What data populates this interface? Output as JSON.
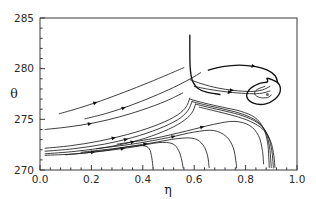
{
  "figure": {
    "name": "phase-portrait",
    "background_color": "#ffffff",
    "line_color": "#1c1c1c",
    "frame_color": "#3a3a3a"
  },
  "chart_data": {
    "type": "line",
    "title": "",
    "subtitle": "",
    "xlabel": "η",
    "ylabel": "θ",
    "xlim": [
      0.0,
      1.0
    ],
    "ylim": [
      270,
      285
    ],
    "grid": false,
    "legend": null,
    "x_ticks": [
      "0.0",
      "0.2",
      "0.4",
      "0.6",
      "0.8",
      "1.0"
    ],
    "x_tick_values": [
      0.0,
      0.2,
      0.4,
      0.6,
      0.8,
      1.0
    ],
    "x_minor_ticks_per_interval": 4,
    "y_ticks": [
      "270",
      "275",
      "280",
      "285"
    ],
    "y_tick_values": [
      270,
      275,
      280,
      285
    ],
    "y_minor_ticks_per_interval": 4,
    "annotations": [
      {
        "name": "spiral-focus",
        "label": "",
        "x": 0.885,
        "y": 277.45,
        "kind": "stable-focus"
      },
      {
        "name": "cusp-spike",
        "label": "",
        "x": 0.583,
        "y": 283.2,
        "kind": "vertical-separatrix"
      }
    ],
    "series": [
      {
        "name": "upper-trajectory-1",
        "points": [
          [
            0.075,
            275.55
          ],
          [
            0.15,
            276.1
          ],
          [
            0.24,
            276.85
          ],
          [
            0.33,
            277.7
          ],
          [
            0.42,
            278.6
          ],
          [
            0.5,
            279.45
          ],
          [
            0.56,
            280.1
          ]
        ],
        "arrows": [
          {
            "t": 0.3,
            "dir": "forward"
          }
        ]
      },
      {
        "name": "upper-trajectory-2",
        "points": [
          [
            0.175,
            275.05
          ],
          [
            0.26,
            275.6
          ],
          [
            0.35,
            276.35
          ],
          [
            0.44,
            277.25
          ],
          [
            0.52,
            278.15
          ],
          [
            0.585,
            279.0
          ],
          [
            0.625,
            279.6
          ]
        ],
        "arrows": [
          {
            "t": 0.34,
            "dir": "forward"
          }
        ]
      },
      {
        "name": "upper-trajectory-3",
        "points": [
          [
            0.02,
            274.0
          ],
          [
            0.11,
            274.25
          ],
          [
            0.21,
            274.65
          ],
          [
            0.31,
            275.25
          ],
          [
            0.4,
            275.95
          ],
          [
            0.49,
            276.8
          ],
          [
            0.555,
            277.6
          ]
        ],
        "arrows": [
          {
            "t": 0.33,
            "dir": "forward"
          }
        ]
      },
      {
        "name": "incoming-separatrix-upper",
        "points": [
          [
            0.583,
            283.3
          ],
          [
            0.583,
            281.6
          ],
          [
            0.584,
            280.3
          ],
          [
            0.588,
            279.3
          ],
          [
            0.597,
            278.6
          ],
          [
            0.615,
            278.05
          ],
          [
            0.645,
            277.7
          ],
          [
            0.7,
            277.45
          ]
        ],
        "arrows": []
      },
      {
        "name": "saddle-branch-left-a",
        "points": [
          [
            0.02,
            272.15
          ],
          [
            0.12,
            272.4
          ],
          [
            0.23,
            272.85
          ],
          [
            0.34,
            273.5
          ],
          [
            0.44,
            274.3
          ],
          [
            0.52,
            275.2
          ],
          [
            0.565,
            276.1
          ],
          [
            0.583,
            277.1
          ]
        ],
        "arrows": [
          {
            "t": 0.45,
            "dir": "forward"
          }
        ]
      },
      {
        "name": "saddle-branch-left-b",
        "points": [
          [
            0.02,
            271.85
          ],
          [
            0.13,
            272.1
          ],
          [
            0.25,
            272.55
          ],
          [
            0.36,
            273.2
          ],
          [
            0.46,
            274.05
          ],
          [
            0.535,
            274.95
          ],
          [
            0.575,
            275.85
          ],
          [
            0.592,
            276.8
          ]
        ],
        "arrows": [
          {
            "t": 0.52,
            "dir": "forward"
          }
        ]
      },
      {
        "name": "saddle-branch-left-c",
        "points": [
          [
            0.02,
            271.6
          ],
          [
            0.14,
            271.85
          ],
          [
            0.27,
            272.3
          ],
          [
            0.385,
            272.95
          ],
          [
            0.48,
            273.8
          ],
          [
            0.55,
            274.7
          ],
          [
            0.59,
            275.6
          ],
          [
            0.605,
            276.5
          ]
        ],
        "arrows": [
          {
            "t": 0.55,
            "dir": "forward"
          }
        ]
      },
      {
        "name": "outgoing-to-spiral-1",
        "points": [
          [
            0.585,
            278.9
          ],
          [
            0.63,
            278.5
          ],
          [
            0.69,
            278.1
          ],
          [
            0.755,
            277.85
          ],
          [
            0.82,
            277.75
          ],
          [
            0.865,
            277.9
          ],
          [
            0.895,
            278.25
          ]
        ],
        "arrows": [
          {
            "t": 0.55,
            "dir": "forward"
          }
        ]
      },
      {
        "name": "outgoing-to-spiral-2",
        "points": [
          [
            0.6,
            278.25
          ],
          [
            0.66,
            277.95
          ],
          [
            0.73,
            277.7
          ],
          [
            0.8,
            277.55
          ],
          [
            0.855,
            277.55
          ],
          [
            0.895,
            277.8
          ]
        ],
        "arrows": [
          {
            "t": 0.5,
            "dir": "forward"
          }
        ]
      },
      {
        "name": "separatrix-over-spiral",
        "points": [
          [
            0.655,
            279.85
          ],
          [
            0.71,
            280.2
          ],
          [
            0.775,
            280.35
          ],
          [
            0.84,
            280.2
          ],
          [
            0.885,
            279.85
          ],
          [
            0.915,
            279.3
          ],
          [
            0.925,
            278.6
          ]
        ],
        "arrows": [
          {
            "t": 0.62,
            "dir": "forward"
          }
        ]
      },
      {
        "name": "limit-cycle-outer",
        "points": [
          [
            0.885,
            279.05
          ],
          [
            0.925,
            278.6
          ],
          [
            0.935,
            277.8
          ],
          [
            0.915,
            277.0
          ],
          [
            0.875,
            276.5
          ],
          [
            0.83,
            276.6
          ],
          [
            0.805,
            277.2
          ],
          [
            0.815,
            277.95
          ],
          [
            0.85,
            278.5
          ],
          [
            0.885,
            278.7
          ]
        ],
        "closed": true,
        "arrows": []
      },
      {
        "name": "spiral-inner",
        "points": [
          [
            0.875,
            278.25
          ],
          [
            0.845,
            277.95
          ],
          [
            0.835,
            277.5
          ],
          [
            0.855,
            277.15
          ],
          [
            0.885,
            277.15
          ],
          [
            0.9,
            277.4
          ]
        ],
        "arrows": []
      },
      {
        "name": "lower-falling-1",
        "points": [
          [
            0.02,
            271.45
          ],
          [
            0.14,
            271.6
          ],
          [
            0.26,
            271.95
          ],
          [
            0.345,
            272.3
          ],
          [
            0.4,
            272.4
          ],
          [
            0.425,
            272.1
          ],
          [
            0.435,
            271.2
          ],
          [
            0.44,
            270.2
          ]
        ],
        "arrows": [
          {
            "t": 0.4,
            "dir": "forward"
          }
        ]
      },
      {
        "name": "lower-falling-2",
        "points": [
          [
            0.1,
            271.5
          ],
          [
            0.24,
            271.85
          ],
          [
            0.37,
            272.3
          ],
          [
            0.46,
            272.7
          ],
          [
            0.515,
            272.6
          ],
          [
            0.54,
            271.9
          ],
          [
            0.552,
            270.9
          ],
          [
            0.557,
            270.2
          ]
        ],
        "arrows": [
          {
            "t": 0.44,
            "dir": "forward"
          }
        ]
      },
      {
        "name": "lower-falling-3",
        "points": [
          [
            0.16,
            271.75
          ],
          [
            0.3,
            272.15
          ],
          [
            0.43,
            272.65
          ],
          [
            0.535,
            273.1
          ],
          [
            0.6,
            273.1
          ],
          [
            0.635,
            272.45
          ],
          [
            0.652,
            271.4
          ],
          [
            0.658,
            270.25
          ]
        ],
        "arrows": [
          {
            "t": 0.45,
            "dir": "forward"
          }
        ]
      },
      {
        "name": "lower-falling-4",
        "points": [
          [
            0.22,
            272.1
          ],
          [
            0.37,
            272.6
          ],
          [
            0.5,
            273.2
          ],
          [
            0.6,
            273.75
          ],
          [
            0.675,
            273.9
          ],
          [
            0.725,
            273.3
          ],
          [
            0.752,
            272.2
          ],
          [
            0.762,
            270.9
          ],
          [
            0.765,
            270.2
          ]
        ],
        "arrows": [
          {
            "t": 0.48,
            "dir": "forward"
          }
        ]
      },
      {
        "name": "lower-falling-5",
        "points": [
          [
            0.3,
            272.55
          ],
          [
            0.44,
            273.1
          ],
          [
            0.57,
            273.85
          ],
          [
            0.675,
            274.5
          ],
          [
            0.755,
            274.8
          ],
          [
            0.815,
            274.4
          ],
          [
            0.85,
            273.4
          ],
          [
            0.865,
            272.0
          ],
          [
            0.87,
            270.6
          ]
        ],
        "arrows": [
          {
            "t": 0.5,
            "dir": "forward"
          }
        ]
      },
      {
        "name": "bundle-descend-1",
        "points": [
          [
            0.583,
            277.0
          ],
          [
            0.64,
            276.6
          ],
          [
            0.71,
            276.2
          ],
          [
            0.78,
            275.8
          ],
          [
            0.835,
            275.2
          ],
          [
            0.868,
            274.2
          ],
          [
            0.885,
            272.8
          ],
          [
            0.89,
            271.3
          ],
          [
            0.892,
            270.25
          ]
        ],
        "arrows": []
      },
      {
        "name": "bundle-descend-2",
        "points": [
          [
            0.592,
            276.75
          ],
          [
            0.655,
            276.35
          ],
          [
            0.725,
            275.95
          ],
          [
            0.79,
            275.5
          ],
          [
            0.845,
            274.8
          ],
          [
            0.878,
            273.75
          ],
          [
            0.893,
            272.3
          ],
          [
            0.898,
            270.9
          ],
          [
            0.9,
            270.25
          ]
        ],
        "arrows": []
      },
      {
        "name": "bundle-descend-3",
        "points": [
          [
            0.605,
            276.5
          ],
          [
            0.67,
            276.1
          ],
          [
            0.74,
            275.7
          ],
          [
            0.805,
            275.2
          ],
          [
            0.858,
            274.45
          ],
          [
            0.888,
            273.35
          ],
          [
            0.902,
            271.9
          ],
          [
            0.907,
            270.6
          ],
          [
            0.908,
            270.2
          ]
        ],
        "arrows": []
      },
      {
        "name": "bundle-descend-4",
        "points": [
          [
            0.62,
            276.2
          ],
          [
            0.685,
            275.8
          ],
          [
            0.755,
            275.35
          ],
          [
            0.818,
            274.8
          ],
          [
            0.868,
            274.0
          ],
          [
            0.897,
            272.85
          ],
          [
            0.91,
            271.4
          ],
          [
            0.914,
            270.25
          ]
        ],
        "arrows": []
      }
    ]
  },
  "axes": {
    "x_axis_name": "eta-axis",
    "y_axis_name": "theta-axis"
  }
}
